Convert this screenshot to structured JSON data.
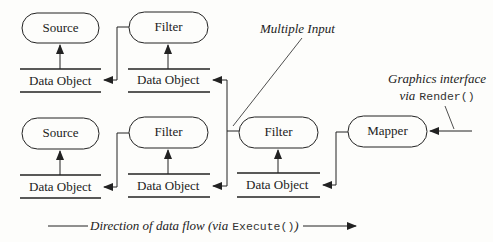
{
  "diagram": {
    "nodes": {
      "source_top": {
        "label": "Source"
      },
      "filter_top": {
        "label": "Filter"
      },
      "source_bottom": {
        "label": "Source"
      },
      "filter_bottom": {
        "label": "Filter"
      },
      "filter_merge": {
        "label": "Filter"
      },
      "mapper": {
        "label": "Mapper"
      }
    },
    "data_objects": {
      "do_source_top": {
        "label": "Data Object"
      },
      "do_filter_top": {
        "label": "Data Object"
      },
      "do_source_bottom": {
        "label": "Data Object"
      },
      "do_filter_bottom": {
        "label": "Data Object"
      },
      "do_filter_merge": {
        "label": "Data Object"
      }
    },
    "annotations": {
      "multiple_input": "Multiple Input",
      "graphics_line1": "Graphics interface",
      "graphics_via": "via",
      "graphics_call": "Render()",
      "flow_text": "Direction of data flow (",
      "flow_via": "via",
      "flow_call": "Execute()",
      "flow_close": ")"
    },
    "colors": {
      "stroke": "#222222",
      "background": "#fdfdfb"
    }
  }
}
